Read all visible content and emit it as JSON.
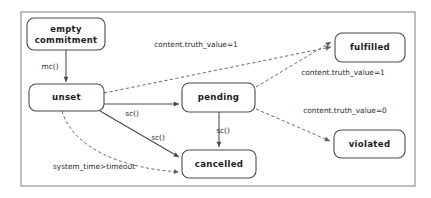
{
  "diagram": {
    "type": "state-diagram",
    "frame": {
      "x": 21,
      "y": 12,
      "width": 394,
      "height": 174
    },
    "colors": {
      "background": "#ffffff",
      "frame_stroke": "#8a8a8a",
      "node_stroke": "#4a4a4a",
      "node_fill": "#ffffff",
      "solid_edge": "#4a4a4a",
      "dashed_edge": "#6b6b6b",
      "text": "#1c1c1c"
    },
    "nodes": [
      {
        "id": "empty-commitment",
        "label_line1": "empty",
        "label_line2": "commitment",
        "x": 27,
        "y": 18,
        "width": 78,
        "height": 32,
        "rx": 7
      },
      {
        "id": "unset",
        "label_line1": "unset",
        "label_line2": "",
        "x": 29,
        "y": 84,
        "width": 75,
        "height": 27,
        "rx": 7
      },
      {
        "id": "pending",
        "label_line1": "pending",
        "label_line2": "",
        "x": 182,
        "y": 83,
        "width": 73,
        "height": 29,
        "rx": 7
      },
      {
        "id": "cancelled",
        "label_line1": "cancelled",
        "label_line2": "",
        "x": 182,
        "y": 150,
        "width": 74,
        "height": 28,
        "rx": 7
      },
      {
        "id": "fulfilled",
        "label_line1": "fulfilled",
        "label_line2": "",
        "x": 335,
        "y": 33,
        "width": 70,
        "height": 29,
        "rx": 7
      },
      {
        "id": "violated",
        "label_line1": "violated",
        "label_line2": "",
        "x": 334,
        "y": 130,
        "width": 71,
        "height": 28,
        "rx": 7
      }
    ],
    "edges": [
      {
        "id": "empty-to-unset",
        "from": "empty-commitment",
        "to": "unset",
        "style": "solid",
        "label": "mc()",
        "label_x": 50,
        "label_y": 67,
        "path": "M 66 50 L 66 82"
      },
      {
        "id": "unset-to-pending",
        "from": "unset",
        "to": "pending",
        "style": "solid",
        "label": "sc()",
        "label_x": 132,
        "label_y": 114,
        "path": "M 104 104 L 179 104"
      },
      {
        "id": "unset-to-cancelled",
        "from": "unset",
        "to": "cancelled",
        "style": "solid",
        "label": "sc()",
        "label_x": 158,
        "label_y": 138,
        "path": "M 100 111 L 179 157"
      },
      {
        "id": "pending-to-cancelled",
        "from": "pending",
        "to": "cancelled",
        "style": "solid",
        "label": "sc()",
        "label_x": 223,
        "label_y": 131,
        "path": "M 219 112 L 219 147"
      },
      {
        "id": "unset-to-fulfilled",
        "from": "unset",
        "to": "fulfilled",
        "style": "dashed",
        "label": "content.truth_value=1",
        "label_x": 196,
        "label_y": 45,
        "path": "M 104 93 L 331 47"
      },
      {
        "id": "pending-to-fulfilled",
        "from": "pending",
        "to": "fulfilled",
        "style": "dashed",
        "label": "content.truth_value=1",
        "label_x": 343,
        "label_y": 73,
        "path": "M 256 87 L 331 42"
      },
      {
        "id": "pending-to-violated",
        "from": "pending",
        "to": "violated",
        "style": "dashed",
        "label": "content.truth_value=0",
        "label_x": 345,
        "label_y": 111,
        "path": "M 256 109 L 330 141"
      },
      {
        "id": "unset-to-cancelled-timeout",
        "from": "unset",
        "to": "cancelled",
        "style": "dashed",
        "label": "system_time>timeout",
        "label_x": 94,
        "label_y": 167,
        "path": "M 62 111 C 72 146 118 168 179 172"
      }
    ]
  }
}
